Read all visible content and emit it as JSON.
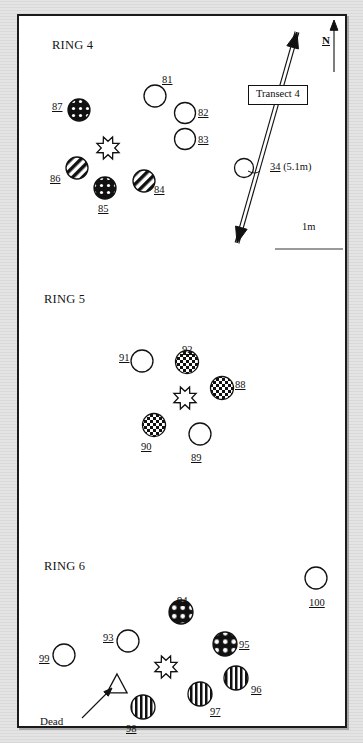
{
  "figure": {
    "background_color": "#dcdcdc",
    "panel_color": "#ffffff",
    "border_color": "#1a1a1a",
    "ink_color": "#101010"
  },
  "annotations": {
    "north_letter": "N",
    "transect_label": "Transect 4",
    "scale_label": "1m",
    "dead_label": "Dead",
    "transect_point_id": "34",
    "transect_point_distance": "(5.1m)"
  },
  "rings": [
    {
      "title": "RING 4",
      "title_x": 52,
      "title_y": 38,
      "symbols": [
        {
          "id": "81",
          "type": "open-circle",
          "cx": 155,
          "cy": 96,
          "r": 11,
          "label_x": 162,
          "label_y": 74
        },
        {
          "id": "82",
          "type": "open-circle",
          "cx": 185,
          "cy": 113,
          "r": 10.5,
          "label_x": 198,
          "label_y": 107
        },
        {
          "id": "83",
          "type": "open-circle",
          "cx": 185,
          "cy": 139,
          "r": 10.5,
          "label_x": 198,
          "label_y": 134
        },
        {
          "id": "84",
          "type": "diagonal-stripe",
          "cx": 144,
          "cy": 181,
          "r": 11,
          "label_x": 154,
          "label_y": 184
        },
        {
          "id": "85",
          "type": "black-dotted",
          "cx": 105,
          "cy": 188,
          "r": 11,
          "label_x": 98,
          "label_y": 203
        },
        {
          "id": "86",
          "type": "diagonal-stripe",
          "cx": 77,
          "cy": 168,
          "r": 11,
          "label_x": 50,
          "label_y": 173
        },
        {
          "id": "87",
          "type": "black-dotted",
          "cx": 79,
          "cy": 110,
          "r": 11,
          "label_x": 52,
          "label_y": 101
        },
        {
          "id": "burst-4",
          "type": "starburst",
          "cx": 108,
          "cy": 148,
          "r": 12,
          "label_x": null,
          "label_y": null
        }
      ]
    },
    {
      "title": "RING 5",
      "title_x": 44,
      "title_y": 292,
      "symbols": [
        {
          "id": "88",
          "type": "checkered",
          "cx": 222,
          "cy": 388,
          "r": 11.5,
          "label_x": 235,
          "label_y": 379
        },
        {
          "id": "89",
          "type": "open-circle",
          "cx": 200,
          "cy": 434,
          "r": 11,
          "label_x": 191,
          "label_y": 452
        },
        {
          "id": "90",
          "type": "checkered",
          "cx": 154,
          "cy": 425,
          "r": 11.5,
          "label_x": 141,
          "label_y": 441
        },
        {
          "id": "91",
          "type": "open-circle",
          "cx": 142,
          "cy": 361,
          "r": 11,
          "label_x": 119,
          "label_y": 352
        },
        {
          "id": "92",
          "type": "checkered",
          "cx": 187,
          "cy": 362,
          "r": 11.5,
          "label_x": 182,
          "label_y": 344
        },
        {
          "id": "burst-5",
          "type": "starburst",
          "cx": 185,
          "cy": 398,
          "r": 12,
          "label_x": null,
          "label_y": null
        }
      ]
    },
    {
      "title": "RING 6",
      "title_x": 44,
      "title_y": 559,
      "symbols": [
        {
          "id": "93",
          "type": "open-circle",
          "cx": 128,
          "cy": 641,
          "r": 11,
          "label_x": 103,
          "label_y": 632
        },
        {
          "id": "94",
          "type": "black-dotted",
          "cx": 181,
          "cy": 612,
          "r": 12,
          "label_x": 177,
          "label_y": 595
        },
        {
          "id": "95",
          "type": "black-dotted",
          "cx": 225,
          "cy": 644,
          "r": 12,
          "label_x": 239,
          "label_y": 639
        },
        {
          "id": "96",
          "type": "vertical-stripe",
          "cx": 236,
          "cy": 678,
          "r": 12,
          "label_x": 251,
          "label_y": 684
        },
        {
          "id": "97",
          "type": "vertical-stripe",
          "cx": 200,
          "cy": 694,
          "r": 12,
          "label_x": 210,
          "label_y": 706
        },
        {
          "id": "98",
          "type": "vertical-stripe",
          "cx": 143,
          "cy": 707,
          "r": 12,
          "label_x": 126,
          "label_y": 723
        },
        {
          "id": "99",
          "type": "open-circle",
          "cx": 64,
          "cy": 655,
          "r": 11,
          "label_x": 39,
          "label_y": 653
        },
        {
          "id": "100",
          "type": "open-circle",
          "cx": 316,
          "cy": 578,
          "r": 11,
          "label_x": 309,
          "label_y": 597
        },
        {
          "id": "burst-6",
          "type": "starburst",
          "cx": 166,
          "cy": 667,
          "r": 12,
          "label_x": null,
          "label_y": null
        },
        {
          "id": "dead-triangle",
          "type": "triangle",
          "cx": 117,
          "cy": 685,
          "r": 11,
          "label_x": null,
          "label_y": null
        }
      ]
    }
  ],
  "transect": {
    "x1": 237,
    "y1": 243,
    "x2": 297,
    "y2": 32,
    "box_x": 248,
    "box_y": 85,
    "marker_cx": 244,
    "marker_cy": 168,
    "marker_r": 9.5,
    "label_x": 270,
    "label_y": 168
  },
  "north_arrow": {
    "x": 334,
    "y_top": 20,
    "y_bottom": 72,
    "letter_x": 329,
    "letter_y": 40
  },
  "scale_bar": {
    "text_x": 302,
    "text_y": 228,
    "rule_x": 275,
    "rule_y": 248,
    "rule_w": 68
  }
}
